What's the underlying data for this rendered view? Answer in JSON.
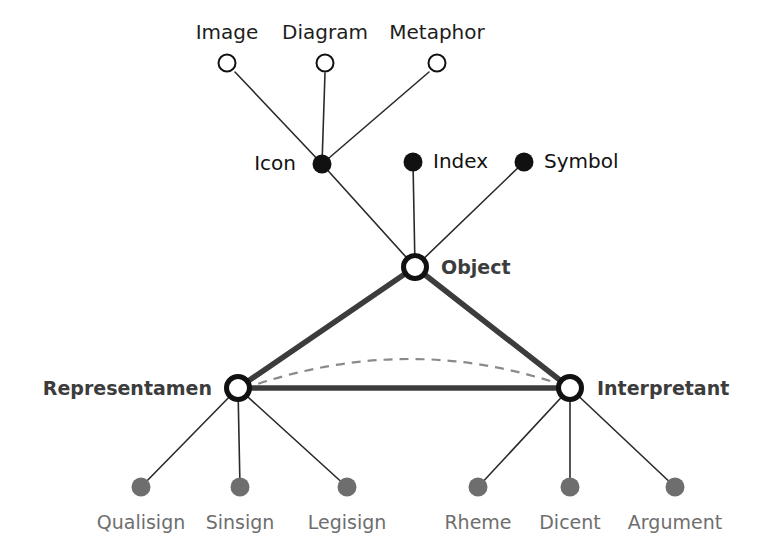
{
  "diagram": {
    "colors": {
      "background": "#ffffff",
      "thin_line": "#2a2a2a",
      "thick_line": "#3c3c3c",
      "dashed_line": "#8a8a8a",
      "open_node_stroke": "#111111",
      "filled_node": "#111111",
      "gray_node": "#6e6e6e",
      "core_label": "#3c3c3c",
      "bottom_label": "#6e6e6e",
      "top_label": "#1d1d1d"
    },
    "nodes": {
      "top_row": [
        {
          "id": "image",
          "label": "Image",
          "x": 227,
          "y": 63,
          "label_x": 227,
          "label_y": 33,
          "style": "open-small"
        },
        {
          "id": "diagram",
          "label": "Diagram",
          "x": 325,
          "y": 63,
          "label_x": 325,
          "label_y": 33,
          "style": "open-small"
        },
        {
          "id": "metaphor",
          "label": "Metaphor",
          "x": 437,
          "y": 63,
          "label_x": 437,
          "label_y": 33,
          "style": "open-small"
        }
      ],
      "middle_row": [
        {
          "id": "icon",
          "label": "Icon",
          "x": 322,
          "y": 164,
          "label_x": 296,
          "label_y": 164,
          "anchor": "end",
          "style": "filled"
        },
        {
          "id": "index",
          "label": "Index",
          "x": 413,
          "y": 162,
          "label_x": 433,
          "label_y": 162,
          "anchor": "start",
          "style": "filled"
        },
        {
          "id": "symbol",
          "label": "Symbol",
          "x": 524,
          "y": 162,
          "label_x": 544,
          "label_y": 162,
          "anchor": "start",
          "style": "filled"
        }
      ],
      "core": [
        {
          "id": "object",
          "label": "Object",
          "x": 415,
          "y": 267,
          "label_x": 441,
          "label_y": 268,
          "anchor": "start",
          "style": "open-core"
        },
        {
          "id": "representamen",
          "label": "Representamen",
          "x": 238,
          "y": 388,
          "label_x": 212,
          "label_y": 389,
          "anchor": "end",
          "style": "open-core"
        },
        {
          "id": "interpretant",
          "label": "Interpretant",
          "x": 570,
          "y": 388,
          "label_x": 597,
          "label_y": 389,
          "anchor": "start",
          "style": "open-core"
        }
      ],
      "bottom_left": [
        {
          "id": "qualisign",
          "label": "Qualisign",
          "x": 141,
          "y": 487,
          "label_x": 141,
          "label_y": 523,
          "style": "gray"
        },
        {
          "id": "sinsign",
          "label": "Sinsign",
          "x": 240,
          "y": 487,
          "label_x": 240,
          "label_y": 523,
          "style": "gray"
        },
        {
          "id": "legisign",
          "label": "Legisign",
          "x": 347,
          "y": 487,
          "label_x": 347,
          "label_y": 523,
          "style": "gray"
        }
      ],
      "bottom_right": [
        {
          "id": "rheme",
          "label": "Rheme",
          "x": 478,
          "y": 487,
          "label_x": 478,
          "label_y": 523,
          "style": "gray"
        },
        {
          "id": "dicent",
          "label": "Dicent",
          "x": 570,
          "y": 487,
          "label_x": 570,
          "label_y": 523,
          "style": "gray"
        },
        {
          "id": "argument",
          "label": "Argument",
          "x": 675,
          "y": 487,
          "label_x": 675,
          "label_y": 523,
          "style": "gray"
        }
      ]
    },
    "edges": {
      "thin_top": [
        {
          "id": "image-icon",
          "x1": 235,
          "y1": 72,
          "x2": 322,
          "y2": 164
        },
        {
          "id": "diagram-icon",
          "x1": 325,
          "y1": 73,
          "x2": 322,
          "y2": 164
        },
        {
          "id": "metaphor-icon",
          "x1": 429,
          "y1": 72,
          "x2": 322,
          "y2": 164
        },
        {
          "id": "icon-object",
          "x1": 322,
          "y1": 164,
          "x2": 415,
          "y2": 267
        },
        {
          "id": "index-object",
          "x1": 413,
          "y1": 162,
          "x2": 415,
          "y2": 267
        },
        {
          "id": "symbol-object",
          "x1": 524,
          "y1": 162,
          "x2": 415,
          "y2": 267
        }
      ],
      "thin_bottom": [
        {
          "id": "representamen-qualisign",
          "x1": 238,
          "y1": 388,
          "x2": 141,
          "y2": 487
        },
        {
          "id": "representamen-sinsign",
          "x1": 238,
          "y1": 388,
          "x2": 240,
          "y2": 487
        },
        {
          "id": "representamen-legisign",
          "x1": 238,
          "y1": 388,
          "x2": 347,
          "y2": 487
        },
        {
          "id": "interpretant-rheme",
          "x1": 570,
          "y1": 388,
          "x2": 478,
          "y2": 487
        },
        {
          "id": "interpretant-dicent",
          "x1": 570,
          "y1": 388,
          "x2": 570,
          "y2": 487
        },
        {
          "id": "interpretant-argument",
          "x1": 570,
          "y1": 388,
          "x2": 675,
          "y2": 487
        }
      ],
      "triangle": [
        {
          "id": "object-representamen",
          "x1": 415,
          "y1": 267,
          "x2": 238,
          "y2": 388
        },
        {
          "id": "object-interpretant",
          "x1": 415,
          "y1": 267,
          "x2": 570,
          "y2": 388
        },
        {
          "id": "representamen-interpretant",
          "x1": 238,
          "y1": 388,
          "x2": 570,
          "y2": 388
        }
      ],
      "dashed_arc": {
        "id": "semiosis-arc",
        "path": "M 243 389 Q 408 330 568 387"
      }
    }
  }
}
